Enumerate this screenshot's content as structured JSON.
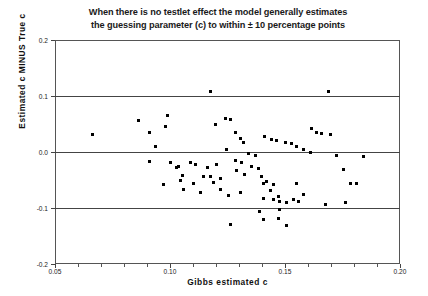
{
  "chart_data": {
    "type": "scatter",
    "title": "When there is no testlet effect the model generally estimates the guessing parameter (c) to within  ± 10 percentage points",
    "title_lines": [
      "When there is no testlet effect the model generally estimates",
      "the guessing parameter (c) to within  ± 10 percentage points"
    ],
    "xlabel": "Gibbs estimated c",
    "ylabel": "Estimated c MINUS True c",
    "xlim": [
      0.05,
      0.2
    ],
    "ylim": [
      -0.2,
      0.2
    ],
    "xticks": [
      0.05,
      0.1,
      0.15,
      0.2
    ],
    "xtick_labels": [
      "0.05",
      "0.10",
      "0.15",
      "0.20"
    ],
    "yticks": [
      0.2,
      0.1,
      0.0,
      -0.1,
      -0.2
    ],
    "ytick_labels": [
      "0.2",
      "0.1",
      "0.0",
      "-0.1",
      "-0.2"
    ],
    "grid": "horizontal-reference-lines-at-0.1-0.0-minus0.1",
    "legend": "none",
    "marker": "filled-square",
    "marker_color": "#000000",
    "points": [
      {
        "x": 0.0661,
        "y": 0.0304
      },
      {
        "x": 0.0863,
        "y": 0.0571
      },
      {
        "x": 0.0913,
        "y": 0.0357
      },
      {
        "x": 0.0935,
        "y": 0.0107
      },
      {
        "x": 0.0987,
        "y": 0.0643
      },
      {
        "x": 0.0979,
        "y": 0.0464
      },
      {
        "x": 0.0913,
        "y": -0.0161
      },
      {
        "x": 0.1001,
        "y": -0.0196
      },
      {
        "x": 0.1037,
        "y": -0.025
      },
      {
        "x": 0.103,
        "y": -0.0268
      },
      {
        "x": 0.1053,
        "y": -0.0411
      },
      {
        "x": 0.1044,
        "y": -0.05
      },
      {
        "x": 0.0972,
        "y": -0.0589
      },
      {
        "x": 0.1088,
        "y": -0.0179
      },
      {
        "x": 0.1111,
        "y": -0.0232
      },
      {
        "x": 0.1161,
        "y": -0.0268
      },
      {
        "x": 0.1204,
        "y": -0.0232
      },
      {
        "x": 0.1146,
        "y": -0.0429
      },
      {
        "x": 0.1175,
        "y": -0.0446
      },
      {
        "x": 0.1218,
        "y": -0.0482
      },
      {
        "x": 0.124,
        "y": 0.0607
      },
      {
        "x": 0.1261,
        "y": 0.0589
      },
      {
        "x": 0.1197,
        "y": 0.05
      },
      {
        "x": 0.1283,
        "y": 0.0357
      },
      {
        "x": 0.1305,
        "y": 0.025
      },
      {
        "x": 0.1319,
        "y": 0.0161
      },
      {
        "x": 0.1247,
        "y": 0.0036
      },
      {
        "x": 0.1341,
        "y": -0.0018
      },
      {
        "x": 0.137,
        "y": -0.0071
      },
      {
        "x": 0.1283,
        "y": -0.0143
      },
      {
        "x": 0.1312,
        "y": -0.0196
      },
      {
        "x": 0.1355,
        "y": -0.025
      },
      {
        "x": 0.1384,
        "y": -0.0286
      },
      {
        "x": 0.129,
        "y": -0.0339
      },
      {
        "x": 0.1326,
        "y": -0.0393
      },
      {
        "x": 0.1398,
        "y": -0.0446
      },
      {
        "x": 0.142,
        "y": -0.0518
      },
      {
        "x": 0.1449,
        "y": -0.0589
      },
      {
        "x": 0.1435,
        "y": -0.0696
      },
      {
        "x": 0.1471,
        "y": -0.0786
      },
      {
        "x": 0.1406,
        "y": -0.0839
      },
      {
        "x": 0.1449,
        "y": -0.0857
      },
      {
        "x": 0.1478,
        "y": -0.0875
      },
      {
        "x": 0.1507,
        "y": -0.0893
      },
      {
        "x": 0.1536,
        "y": -0.0857
      },
      {
        "x": 0.1558,
        "y": -0.0875
      },
      {
        "x": 0.1391,
        "y": -0.1054
      },
      {
        "x": 0.1478,
        "y": -0.1018
      },
      {
        "x": 0.1471,
        "y": -0.1179
      },
      {
        "x": 0.1406,
        "y": -0.1214
      },
      {
        "x": 0.1413,
        "y": 0.0268
      },
      {
        "x": 0.1442,
        "y": 0.0232
      },
      {
        "x": 0.1464,
        "y": 0.0214
      },
      {
        "x": 0.15,
        "y": 0.0161
      },
      {
        "x": 0.1529,
        "y": 0.0143
      },
      {
        "x": 0.1551,
        "y": 0.0107
      },
      {
        "x": 0.158,
        "y": 0.0036
      },
      {
        "x": 0.1609,
        "y": 0.0
      },
      {
        "x": 0.1638,
        "y": 0.0357
      },
      {
        "x": 0.1616,
        "y": 0.0411
      },
      {
        "x": 0.1659,
        "y": 0.0339
      },
      {
        "x": 0.1688,
        "y": 0.1089
      },
      {
        "x": 0.1174,
        "y": 0.1089
      },
      {
        "x": 0.1696,
        "y": 0.0321
      },
      {
        "x": 0.1725,
        "y": -0.0054
      },
      {
        "x": 0.1753,
        "y": -0.0321
      },
      {
        "x": 0.1783,
        "y": -0.0554
      },
      {
        "x": 0.1812,
        "y": -0.0554
      },
      {
        "x": 0.1841,
        "y": -0.0089
      },
      {
        "x": 0.1551,
        "y": -0.0554
      },
      {
        "x": 0.1406,
        "y": -0.0554
      },
      {
        "x": 0.1674,
        "y": -0.0929
      },
      {
        "x": 0.1261,
        "y": -0.1286
      },
      {
        "x": 0.1507,
        "y": -0.1321
      },
      {
        "x": 0.1189,
        "y": -0.0536
      },
      {
        "x": 0.1102,
        "y": -0.0554
      },
      {
        "x": 0.1059,
        "y": -0.0661
      },
      {
        "x": 0.1131,
        "y": -0.0732
      },
      {
        "x": 0.1305,
        "y": -0.0732
      },
      {
        "x": 0.1254,
        "y": -0.0768
      },
      {
        "x": 0.1218,
        "y": -0.0661
      },
      {
        "x": 0.158,
        "y": -0.075
      },
      {
        "x": 0.1761,
        "y": -0.0893
      }
    ]
  }
}
